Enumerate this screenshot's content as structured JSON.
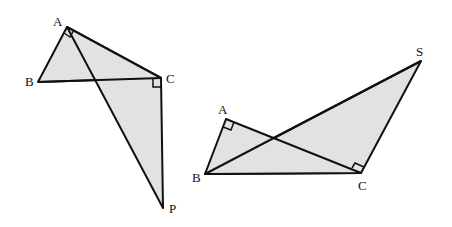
{
  "figure_left": {
    "labels": {
      "A": "A",
      "B": "B",
      "C": "C",
      "P": "P"
    },
    "points": {
      "A": [
        67,
        27
      ],
      "B": [
        38,
        82
      ],
      "C": [
        161,
        78
      ],
      "P": [
        163,
        208
      ]
    },
    "right_angles": [
      "BAC",
      "ACP"
    ],
    "shaded": [
      "ABC",
      "APC"
    ]
  },
  "figure_right": {
    "labels": {
      "A": "A",
      "B": "B",
      "C": "C",
      "S": "S"
    },
    "points": {
      "A": [
        226,
        119
      ],
      "B": [
        205,
        174
      ],
      "C": [
        361,
        173
      ],
      "S": [
        421,
        61
      ]
    },
    "right_angles": [
      "BAC",
      "BCS"
    ],
    "shaded": [
      "ABC",
      "BCS"
    ]
  },
  "colors": {
    "fill": "#e2e2e2",
    "stroke": "#111111"
  }
}
